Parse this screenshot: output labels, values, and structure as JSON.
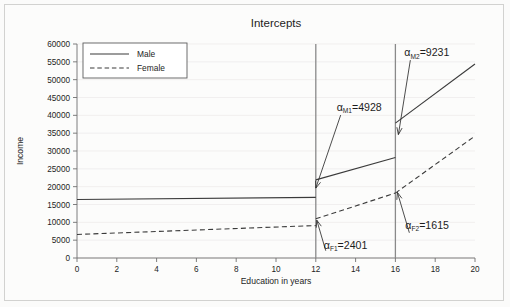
{
  "chart_data": {
    "type": "line",
    "title": "Intercepts",
    "xlabel": "Education in years",
    "ylabel": "Income",
    "xlim": [
      0,
      20
    ],
    "ylim": [
      0,
      60000
    ],
    "x_ticks": [
      0,
      2,
      4,
      6,
      8,
      10,
      12,
      14,
      16,
      18,
      20
    ],
    "y_ticks": [
      0,
      5000,
      10000,
      15000,
      20000,
      25000,
      30000,
      35000,
      40000,
      45000,
      50000,
      55000,
      60000
    ],
    "grid": true,
    "legend_position": "top-left",
    "legend": [
      "Male",
      "Female"
    ],
    "series": [
      {
        "name": "Male",
        "style": "solid",
        "segments": [
          {
            "x": [
              0,
              12
            ],
            "y": [
              16400,
              17000
            ]
          },
          {
            "x": [
              12,
              16
            ],
            "y": [
              21900,
              28200
            ]
          },
          {
            "x": [
              16,
              20
            ],
            "y": [
              37800,
              54400
            ]
          }
        ]
      },
      {
        "name": "Female",
        "style": "dashed",
        "segments": [
          {
            "x": [
              0,
              12
            ],
            "y": [
              6600,
              9100
            ]
          },
          {
            "x": [
              12,
              16
            ],
            "y": [
              11000,
              18200
            ]
          },
          {
            "x": [
              16,
              20
            ],
            "y": [
              18200,
              34200
            ]
          }
        ]
      }
    ],
    "vertical_reference_lines": [
      12,
      16
    ],
    "annotations": [
      {
        "id": "alpha-m1",
        "symbol": "α",
        "subscript": "M1",
        "equals_value": "=4928",
        "text": "αM1=4928",
        "label_x": 13.05,
        "label_y": 41200,
        "points_to_x": 12,
        "points_to_y": 19600,
        "meaning": "Male jump at 12 years of education"
      },
      {
        "id": "alpha-m2",
        "symbol": "α",
        "subscript": "M2",
        "equals_value": "=9231",
        "text": "αM2=9231",
        "label_x": 16.45,
        "label_y": 56600,
        "points_to_x": 16.15,
        "points_to_y": 34600,
        "meaning": "Male jump at 16 years of education"
      },
      {
        "id": "alpha-f1",
        "symbol": "α",
        "subscript": "F1",
        "equals_value": "=2401",
        "text": "αF1=2401",
        "label_x": 12.4,
        "label_y": 2600,
        "points_to_x": 12.05,
        "points_to_y": 10600,
        "meaning": "Female jump at 12 years of education"
      },
      {
        "id": "alpha-f2",
        "symbol": "α",
        "subscript": "F2",
        "equals_value": "=1615",
        "text": "αF2=1615",
        "label_x": 16.5,
        "label_y": 8200,
        "points_to_x": 16.1,
        "points_to_y": 18400,
        "meaning": "Female jump at 16 years of education"
      }
    ],
    "colors": {
      "line": "#3b3b3b",
      "axis": "#6f6f6f",
      "grid": "#eceaea",
      "reference_line": "#8a8a8a",
      "background": "#fcfcfb"
    }
  }
}
